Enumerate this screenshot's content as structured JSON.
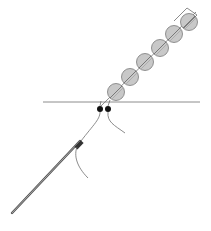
{
  "diagram": {
    "colors": {
      "background": "#ffffff",
      "bead_fill": "#c8c8c8",
      "bead_stroke": "#7a7a7a",
      "thread": "#6e6e6e",
      "needle": "#6a6a6a",
      "knot": "#111111",
      "baseline": "#808080"
    },
    "beads": [
      {
        "cx": 116,
        "cy": 92,
        "r": 8.5
      },
      {
        "cx": 130,
        "cy": 77,
        "r": 8.5
      },
      {
        "cx": 145,
        "cy": 62,
        "r": 8.5
      },
      {
        "cx": 160,
        "cy": 48,
        "r": 8.5
      },
      {
        "cx": 174,
        "cy": 34,
        "r": 8.5
      },
      {
        "cx": 189,
        "cy": 22,
        "r": 8.5
      }
    ],
    "end_frame": {
      "x1": 185,
      "y1": 8,
      "x2": 196,
      "y2": 16
    },
    "baseline": {
      "x1": 43,
      "y1": 102,
      "x2": 200,
      "y2": 102
    },
    "knots": [
      {
        "cx": 100,
        "cy": 109,
        "r": 3
      },
      {
        "cx": 108,
        "cy": 109,
        "r": 3
      }
    ]
  }
}
